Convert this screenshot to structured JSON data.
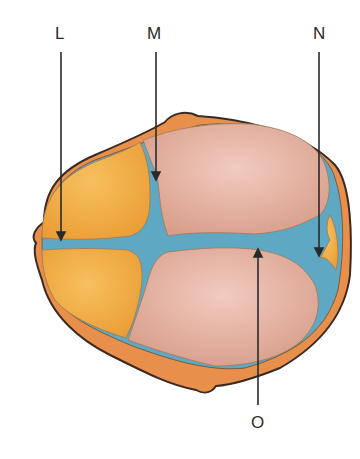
{
  "diagram": {
    "labels": [
      {
        "id": "L",
        "text": "L"
      },
      {
        "id": "M",
        "text": "M"
      },
      {
        "id": "N",
        "text": "N"
      },
      {
        "id": "O",
        "text": "O"
      }
    ],
    "colors": {
      "outline": "#3a2a22",
      "rim": "#e98f4c",
      "frontal_bone": "#f0a640",
      "parietal_bone": "#dba08f",
      "suture": "#5fa8c4",
      "pointer": "#2a2a2a"
    }
  }
}
